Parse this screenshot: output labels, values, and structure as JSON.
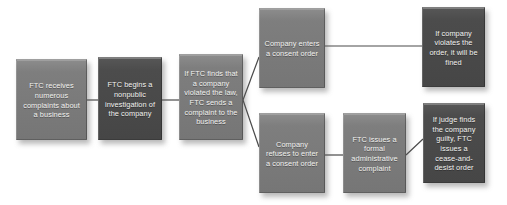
{
  "diagram": {
    "background_color": "#ffffff",
    "connector_color": "#4a4a4a",
    "box_fill_mid": "#7e7e7e",
    "box_fill_dark": "#4c4c4c",
    "text_color": "#f2f2f0",
    "nodes": [
      {
        "id": "ftc-receives-complaints",
        "text": "FTC receives numerous complaints about a business",
        "shade": "mid",
        "x": 16,
        "y": 59,
        "w": 71,
        "h": 81
      },
      {
        "id": "ftc-begins-investigation",
        "text": "FTC begins a nonpublic investigation of the company",
        "shade": "dark",
        "x": 98,
        "y": 57,
        "w": 64,
        "h": 83
      },
      {
        "id": "ftc-sends-complaint",
        "text": "If FTC finds that a company violated the law, FTC sends a complaint to the business",
        "shade": "mid",
        "x": 179,
        "y": 54,
        "w": 64,
        "h": 86
      },
      {
        "id": "company-enters-consent-order",
        "text": "Company enters a consent order",
        "shade": "mid",
        "x": 259,
        "y": 8,
        "w": 66,
        "h": 80
      },
      {
        "id": "company-violates-order-fined",
        "text": "If company violates the order, it will be fined",
        "shade": "dark",
        "x": 422,
        "y": 7,
        "w": 63,
        "h": 80
      },
      {
        "id": "company-refuses-consent-order",
        "text": "Company refuses to enter a consent order",
        "shade": "mid",
        "x": 259,
        "y": 113,
        "w": 66,
        "h": 80
      },
      {
        "id": "ftc-issues-administrative-complaint",
        "text": "FTC issues a formal administrative complaint",
        "shade": "mid",
        "x": 343,
        "y": 113,
        "w": 63,
        "h": 80
      },
      {
        "id": "judge-finds-guilty-cease-desist",
        "text": "If judge finds the company guilty, FTC issues a cease-and-desist order",
        "shade": "dark",
        "x": 423,
        "y": 103,
        "w": 62,
        "h": 80
      }
    ],
    "connectors": [
      {
        "id": "conn-receives-to-investigation",
        "x1": 87,
        "y1": 100,
        "x2": 98,
        "y2": 100
      },
      {
        "id": "conn-investigation-to-complaint",
        "x1": 162,
        "y1": 100,
        "x2": 179,
        "y2": 100
      },
      {
        "id": "conn-complaint-to-consent-order",
        "x1": 243,
        "y1": 100,
        "x2": 259,
        "y2": 57
      },
      {
        "id": "conn-complaint-to-refuses",
        "x1": 243,
        "y1": 100,
        "x2": 259,
        "y2": 147
      },
      {
        "id": "conn-consent-order-to-fined",
        "x1": 325,
        "y1": 46,
        "x2": 422,
        "y2": 46
      },
      {
        "id": "conn-refuses-to-admin-complaint",
        "x1": 325,
        "y1": 155,
        "x2": 343,
        "y2": 155
      },
      {
        "id": "conn-admin-complaint-to-judge",
        "x1": 406,
        "y1": 155,
        "x2": 423,
        "y2": 139
      }
    ]
  }
}
